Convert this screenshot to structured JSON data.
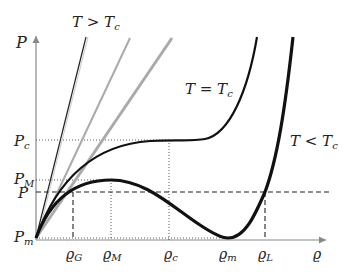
{
  "diagram": {
    "axes": {
      "x_label": "ϱ",
      "y_label": "P"
    },
    "y_ticks": [
      {
        "label": "P",
        "sub": "c",
        "y": 140
      },
      {
        "label": "P",
        "sub": "M",
        "y": 180
      },
      {
        "label": "P",
        "sub": "",
        "y": 192
      },
      {
        "label": "P",
        "sub": "m",
        "y": 238
      }
    ],
    "x_ticks": [
      {
        "label": "ϱ",
        "sub": "G",
        "x": 73
      },
      {
        "label": "ϱ",
        "sub": "M",
        "x": 111
      },
      {
        "label": "ϱ",
        "sub": "c",
        "x": 169
      },
      {
        "label": "ϱ",
        "sub": "m",
        "x": 226
      },
      {
        "label": "ϱ",
        "sub": "L",
        "x": 265
      }
    ],
    "curve_labels": {
      "above_critical": "T > T",
      "above_critical_sub": "c",
      "critical": "T = T",
      "critical_sub": "c",
      "below_critical": "T < T",
      "below_critical_sub": "c"
    },
    "colors": {
      "curve": "#111111",
      "gray_line": "#aaaaaa",
      "axis": "#888888",
      "guide": "#333333"
    }
  }
}
